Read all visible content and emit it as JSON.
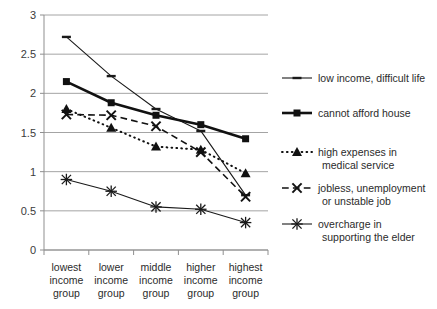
{
  "chart_data": {
    "type": "line",
    "title": "",
    "xlabel": "",
    "ylabel": "",
    "ylim": [
      0,
      3
    ],
    "ytick_labels": [
      "0",
      "0.5",
      "1",
      "1.5",
      "2",
      "2.5",
      "3"
    ],
    "ytick_values": [
      0,
      0.5,
      1,
      1.5,
      2,
      2.5,
      3
    ],
    "grid": true,
    "legend_position": "right",
    "categories": [
      "lowest income group",
      "lower income group",
      "middle income group",
      "higher income group",
      "highest income group"
    ],
    "category_lines": [
      [
        "lowest",
        "income",
        "group"
      ],
      [
        "lower",
        "income",
        "group"
      ],
      [
        "middle",
        "income",
        "group"
      ],
      [
        "higher",
        "income",
        "group"
      ],
      [
        "highest",
        "income",
        "group"
      ]
    ],
    "series": [
      {
        "name": "low income, difficult life",
        "name_lines": [
          "low income, difficult life"
        ],
        "marker": "dash",
        "line_style": "solid",
        "line_width": 1.1,
        "color": "#1a1a1a",
        "values": [
          2.72,
          2.22,
          1.8,
          1.52,
          0.7
        ]
      },
      {
        "name": "cannot afford house",
        "name_lines": [
          "cannot afford house"
        ],
        "marker": "square",
        "line_style": "solid",
        "line_width": 2.6,
        "color": "#111111",
        "values": [
          2.15,
          1.88,
          1.72,
          1.6,
          1.42
        ]
      },
      {
        "name": "high expenses in medical service",
        "name_lines": [
          "high expenses in",
          "medical service"
        ],
        "marker": "triangle",
        "line_style": "dotted",
        "line_width": 2.0,
        "color": "#111111",
        "values": [
          1.8,
          1.56,
          1.32,
          1.28,
          0.98
        ]
      },
      {
        "name": "jobless, unemployment or unstable job",
        "name_lines": [
          "jobless, unemployment",
          "or unstable job"
        ],
        "marker": "x",
        "line_style": "dashed",
        "line_width": 1.6,
        "color": "#111111",
        "values": [
          1.73,
          1.72,
          1.58,
          1.25,
          0.68
        ]
      },
      {
        "name": "overcharge in supporting the elder",
        "name_lines": [
          "overcharge in",
          "supporting the elder"
        ],
        "marker": "asterisk",
        "line_style": "solid",
        "line_width": 1.1,
        "color": "#1a1a1a",
        "values": [
          0.9,
          0.75,
          0.55,
          0.52,
          0.35
        ]
      }
    ]
  }
}
